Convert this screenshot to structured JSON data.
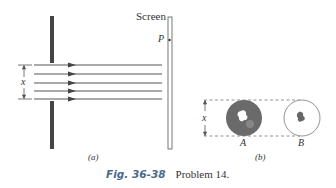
{
  "figure": {
    "panel_a": {
      "label": "(a)",
      "screen_label": "Screen",
      "point_label": "P",
      "aperture_width_label": "x",
      "ray_count": 5
    },
    "panel_b": {
      "label": "(b)",
      "width_label": "x",
      "objects": [
        {
          "label": "A",
          "description": "dark disk with light irregular center"
        },
        {
          "label": "B",
          "description": "light disk with dark irregular center"
        }
      ]
    },
    "caption": {
      "figure_number": "Fig. 36-38",
      "text": "Problem 14."
    }
  }
}
